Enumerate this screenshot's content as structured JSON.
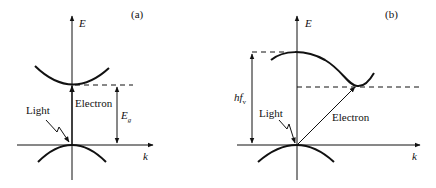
{
  "panels": [
    {
      "id": "a",
      "tag": "(a)",
      "axis_y": "E",
      "axis_x": "k",
      "labels": {
        "light": "Light",
        "electron": "Electron",
        "gap": "E",
        "gap_sub": "g"
      },
      "type": "direct band gap"
    },
    {
      "id": "b",
      "tag": "(b)",
      "axis_y": "E",
      "axis_x": "k",
      "labels": {
        "light": "Light",
        "electron": "Electron",
        "energy": "hf",
        "energy_sub": "v"
      },
      "type": "indirect band gap"
    }
  ],
  "colors": {
    "ink": "#111111",
    "background": "#ffffff"
  }
}
